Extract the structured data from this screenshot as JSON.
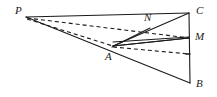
{
  "figure": {
    "type": "geometry-diagram",
    "canvas": {
      "width": 217,
      "height": 97
    },
    "colors": {
      "background": "#ffffff",
      "stroke": "#1a1a1a",
      "label": "#1a1a1a"
    },
    "stroke_width": 1.1,
    "dash_pattern": "4 3",
    "points": [
      {
        "name": "P",
        "label": "P",
        "x": 26,
        "y": 17,
        "label_x": 15,
        "label_y": 5
      },
      {
        "name": "C",
        "label": "C",
        "x": 189,
        "y": 13,
        "label_x": 196,
        "label_y": 6
      },
      {
        "name": "M",
        "label": "M",
        "x": 189,
        "y": 38,
        "label_x": 196,
        "label_y": 32
      },
      {
        "name": "B",
        "label": "B",
        "x": 190,
        "y": 83,
        "label_x": 196,
        "label_y": 79
      },
      {
        "name": "A",
        "label": "A",
        "x": 113,
        "y": 46,
        "label_x": 105,
        "label_y": 52
      },
      {
        "name": "N",
        "label": "N",
        "x": 150,
        "y": 28,
        "label_x": 144,
        "label_y": 13
      },
      {
        "name": "D",
        "label": "",
        "x": 189,
        "y": 54,
        "label_x": 0,
        "label_y": 0
      }
    ],
    "segments": [
      {
        "name": "P-C",
        "from": "P",
        "to": "C",
        "style": "solid"
      },
      {
        "name": "P-A",
        "from": "P",
        "to": "A",
        "style": "solid"
      },
      {
        "name": "A-B",
        "from": "A",
        "to": "B",
        "style": "solid"
      },
      {
        "name": "C-B",
        "from": "C",
        "to": "B",
        "style": "solid"
      },
      {
        "name": "A-C",
        "from": "A",
        "to": "C",
        "style": "solid"
      },
      {
        "name": "A-M",
        "from": "A",
        "to": "M",
        "style": "solid"
      },
      {
        "name": "N-M",
        "from": "N",
        "to": "M",
        "style": "solid"
      },
      {
        "name": "P-M",
        "from": "P",
        "to": "M",
        "style": "dashed"
      },
      {
        "name": "P-D",
        "from": "P",
        "to": "D",
        "style": "dashed"
      },
      {
        "name": "A-D",
        "from": "A",
        "to": "D",
        "style": "dashed"
      }
    ],
    "labels": [
      "P",
      "C",
      "M",
      "B",
      "A",
      "N"
    ]
  }
}
